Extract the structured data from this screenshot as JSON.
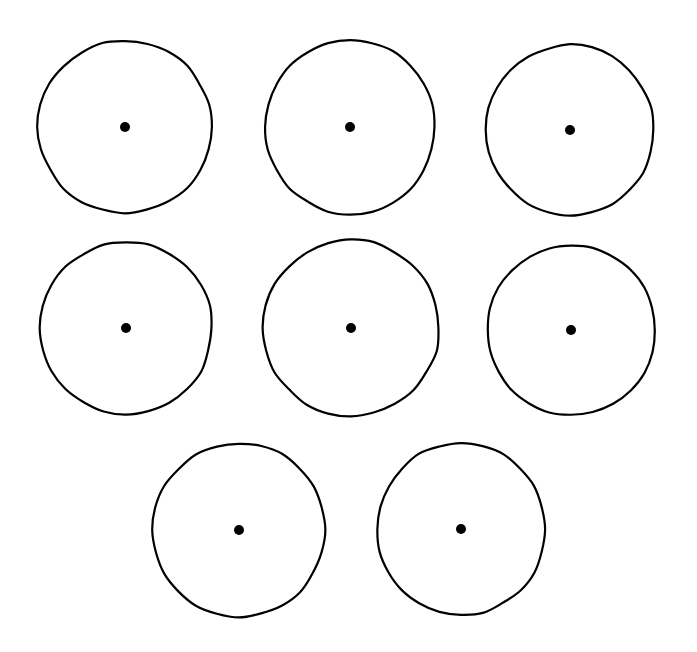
{
  "figure": {
    "background_color": "#ffffff",
    "width": 697,
    "height": 652,
    "shape_count": 8,
    "row_layout": [
      3,
      3,
      2
    ]
  },
  "style": {
    "outline_color": "#000000",
    "outline_width": 2.2,
    "dot_color": "#000000",
    "dot_radius": 5.0,
    "hand_drawn": true
  },
  "chart_data": {
    "type": "scatter",
    "xlabel": "",
    "ylabel": "",
    "xlim": [
      0,
      697
    ],
    "ylim": [
      0,
      652
    ],
    "grid": false,
    "legend": "none",
    "units": "pixels",
    "series": [
      {
        "name": "circle outlines",
        "marker": "open-circle",
        "values": [
          {
            "id": "circle-1",
            "row": 1,
            "col": 1,
            "cx": 125,
            "cy": 127,
            "rx": 87,
            "ry": 86
          },
          {
            "id": "circle-2",
            "row": 1,
            "col": 2,
            "cx": 350,
            "cy": 127,
            "rx": 85,
            "ry": 87
          },
          {
            "id": "circle-3",
            "row": 1,
            "col": 3,
            "cx": 570,
            "cy": 130,
            "rx": 84,
            "ry": 85
          },
          {
            "id": "circle-4",
            "row": 2,
            "col": 1,
            "cx": 126,
            "cy": 328,
            "rx": 86,
            "ry": 86
          },
          {
            "id": "circle-5",
            "row": 2,
            "col": 2,
            "cx": 351,
            "cy": 328,
            "rx": 88,
            "ry": 88
          },
          {
            "id": "circle-6",
            "row": 2,
            "col": 3,
            "cx": 571,
            "cy": 330,
            "rx": 84,
            "ry": 85
          },
          {
            "id": "circle-7",
            "row": 3,
            "col": 1,
            "cx": 239,
            "cy": 530,
            "rx": 86,
            "ry": 87
          },
          {
            "id": "circle-8",
            "row": 3,
            "col": 2,
            "cx": 461,
            "cy": 529,
            "rx": 84,
            "ry": 86
          }
        ]
      },
      {
        "name": "center dots",
        "marker": "filled-circle",
        "values": [
          {
            "id": "dot-1",
            "cx": 125,
            "cy": 127,
            "r": 5.0
          },
          {
            "id": "dot-2",
            "cx": 350,
            "cy": 127,
            "r": 5.0
          },
          {
            "id": "dot-3",
            "cx": 570,
            "cy": 130,
            "r": 5.0
          },
          {
            "id": "dot-4",
            "cx": 126,
            "cy": 328,
            "r": 5.0
          },
          {
            "id": "dot-5",
            "cx": 351,
            "cy": 328,
            "r": 5.0
          },
          {
            "id": "dot-6",
            "cx": 571,
            "cy": 330,
            "r": 5.0
          },
          {
            "id": "dot-7",
            "cx": 239,
            "cy": 530,
            "r": 5.0
          },
          {
            "id": "dot-8",
            "cx": 461,
            "cy": 529,
            "r": 5.0
          }
        ]
      }
    ]
  }
}
